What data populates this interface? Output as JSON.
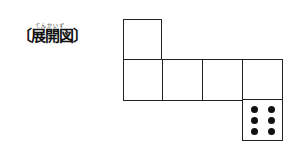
{
  "title": {
    "ruby": "てんかいず",
    "text": "〔展開図〕"
  },
  "net": {
    "description": "cube net with six squares",
    "squares": [
      {
        "id": "top",
        "face_value": null
      },
      {
        "id": "row-1",
        "face_value": null
      },
      {
        "id": "row-2",
        "face_value": null
      },
      {
        "id": "row-3",
        "face_value": null
      },
      {
        "id": "row-4",
        "face_value": null
      },
      {
        "id": "bottom",
        "face_value": 6
      }
    ],
    "dot_color": "#111111",
    "line_color": "#222222"
  }
}
